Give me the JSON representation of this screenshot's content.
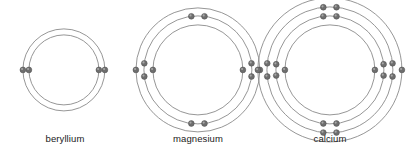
{
  "figure": {
    "background_color": "#ffffff",
    "shell_stroke_color": "#8a8a8a",
    "electron_fill_color": "#6e6e6e",
    "label_color": "#1a1a1a"
  },
  "atoms": [
    {
      "id": "beryllium",
      "label": "beryllium",
      "symbol": "Be",
      "atomic_number": 4,
      "shell_count": 2,
      "shell_configuration": [
        2,
        2
      ],
      "total_electrons": 4,
      "center": {
        "x": 64,
        "y": 70
      },
      "shell_radii": [
        41,
        35
      ],
      "label_position": {
        "x": 0,
        "y": 133,
        "width": 130
      },
      "electrons": [
        {
          "shell": 0,
          "angle": 180
        },
        {
          "shell": 0,
          "angle": 0
        },
        {
          "shell": 1,
          "angle": 180
        },
        {
          "shell": 1,
          "angle": 0
        }
      ]
    },
    {
      "id": "magnesium",
      "label": "magnesium",
      "symbol": "Mg",
      "atomic_number": 12,
      "shell_count": 3,
      "shell_configuration": [
        2,
        8,
        2
      ],
      "total_electrons": 12,
      "center": {
        "x": 198,
        "y": 70
      },
      "shell_radii": [
        62,
        54,
        45
      ],
      "label_position": {
        "x": 133,
        "y": 133,
        "width": 130
      },
      "electrons": [
        {
          "shell": 0,
          "angle": 180
        },
        {
          "shell": 0,
          "angle": 0
        },
        {
          "shell": 1,
          "angle": 173
        },
        {
          "shell": 1,
          "angle": 187
        },
        {
          "shell": 1,
          "angle": 7
        },
        {
          "shell": 1,
          "angle": -7
        },
        {
          "shell": 1,
          "angle": 97
        },
        {
          "shell": 1,
          "angle": 83
        },
        {
          "shell": 1,
          "angle": 263
        },
        {
          "shell": 1,
          "angle": 277
        },
        {
          "shell": 2,
          "angle": 180
        },
        {
          "shell": 2,
          "angle": 0
        }
      ]
    },
    {
      "id": "calcium",
      "label": "calcium",
      "symbol": "Ca",
      "atomic_number": 20,
      "shell_count": 4,
      "shell_configuration": [
        2,
        8,
        8,
        2
      ],
      "total_electrons": 20,
      "center": {
        "x": 330,
        "y": 70
      },
      "shell_radii": [
        72,
        63,
        54,
        45
      ],
      "label_position": {
        "x": 265,
        "y": 133,
        "width": 130
      },
      "electrons": [
        {
          "shell": 0,
          "angle": 180
        },
        {
          "shell": 0,
          "angle": 0
        },
        {
          "shell": 1,
          "angle": 174
        },
        {
          "shell": 1,
          "angle": 186
        },
        {
          "shell": 1,
          "angle": 6
        },
        {
          "shell": 1,
          "angle": -6
        },
        {
          "shell": 1,
          "angle": 96
        },
        {
          "shell": 1,
          "angle": 84
        },
        {
          "shell": 1,
          "angle": 264
        },
        {
          "shell": 1,
          "angle": 276
        },
        {
          "shell": 2,
          "angle": 174
        },
        {
          "shell": 2,
          "angle": 186
        },
        {
          "shell": 2,
          "angle": 6
        },
        {
          "shell": 2,
          "angle": -6
        },
        {
          "shell": 2,
          "angle": 97
        },
        {
          "shell": 2,
          "angle": 83
        },
        {
          "shell": 2,
          "angle": 263
        },
        {
          "shell": 2,
          "angle": 277
        },
        {
          "shell": 3,
          "angle": 180
        },
        {
          "shell": 3,
          "angle": 0
        }
      ]
    }
  ]
}
